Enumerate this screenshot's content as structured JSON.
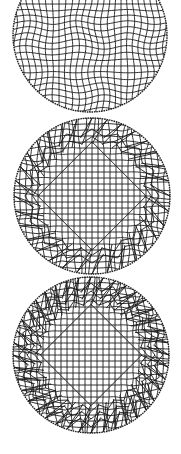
{
  "figure": {
    "background": "#ffffff",
    "line_color": "#1a1a1a",
    "rim_color": "#222222",
    "panels": [
      {
        "id": "mesh-wavy",
        "cx": 90,
        "cy": 35,
        "r": 77,
        "spacing": 6.2,
        "style": "wavy",
        "amplitude": 2.2
      },
      {
        "id": "mesh-diamond-refined",
        "cx": 92,
        "cy": 196,
        "r": 78,
        "spacing": 6.0,
        "style": "diamond",
        "inner_fraction": 0.62,
        "spikes": 16
      },
      {
        "id": "mesh-diamond-dense",
        "cx": 91,
        "cy": 355,
        "r": 78,
        "spacing": 6.0,
        "style": "diamond-dense",
        "inner_fraction": 0.58,
        "spikes": 20
      }
    ]
  }
}
